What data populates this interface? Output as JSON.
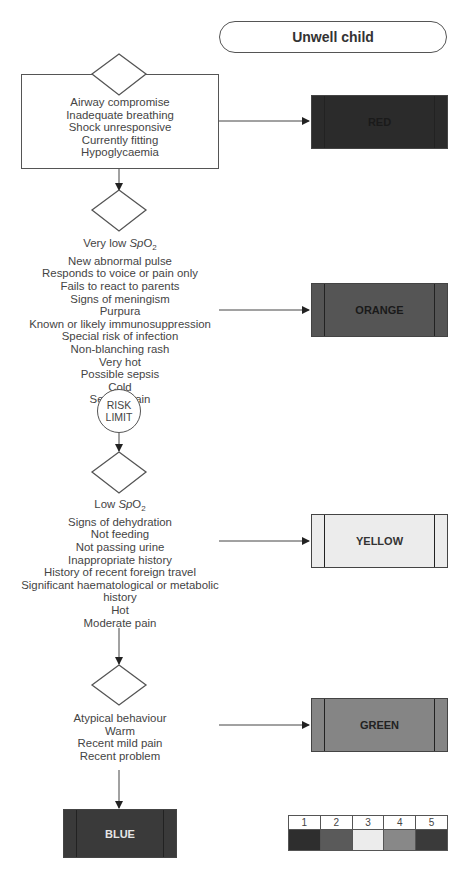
{
  "title": "Unwell child",
  "risk_limit": [
    "RISK",
    "LIMIT"
  ],
  "levels": [
    {
      "id": "red",
      "label": "RED",
      "color": "#2b2b2b",
      "text_color": "#1a1a1a",
      "criteria": [
        "Airway compromise",
        "Inadequate breathing",
        "Shock unresponsive",
        "Currently fitting",
        "Hypoglycaemia"
      ]
    },
    {
      "id": "orange",
      "label": "ORANGE",
      "color": "#555555",
      "text_color": "#1a1a1a",
      "criteria": [
        "Very low SpO2",
        "New abnormal pulse",
        "Responds to voice or pain only",
        "Fails to react to parents",
        "Signs of meningism",
        "Purpura",
        "Known or likely immunosuppression",
        "Special risk of infection",
        "Non-blanching rash",
        "Very hot",
        "Possible sepsis",
        "Cold",
        "Severe pain"
      ]
    },
    {
      "id": "yellow",
      "label": "YELLOW",
      "color": "#ececec",
      "text_color": "#333333",
      "criteria": [
        "Low SpO2",
        "Signs of dehydration",
        "Not feeding",
        "Not passing urine",
        "Inappropriate history",
        "History of recent foreign travel",
        "Significant haematological or metabolic",
        "history",
        "Hot",
        "Moderate pain"
      ]
    },
    {
      "id": "green",
      "label": "GREEN",
      "color": "#858585",
      "text_color": "#222222",
      "criteria": [
        "Atypical behaviour",
        "Warm",
        "Recent mild pain",
        "Recent problem"
      ]
    }
  ],
  "default_level": {
    "id": "blue",
    "label": "BLUE",
    "color": "#3a3a3a",
    "text_color": "#e6e6e6"
  },
  "legend": {
    "numbers": [
      "1",
      "2",
      "3",
      "4",
      "5"
    ],
    "colors": [
      "#2e2e2e",
      "#5a5a5a",
      "#ececec",
      "#888888",
      "#3a3a3a"
    ]
  }
}
